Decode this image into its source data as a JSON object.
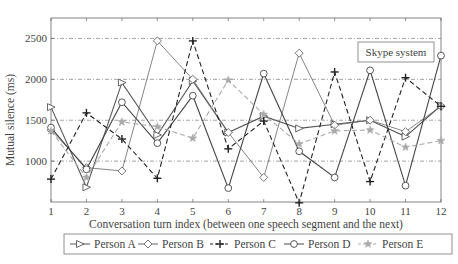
{
  "chart_data": {
    "type": "line",
    "title": "",
    "annotation": "Skype system",
    "xlabel": "Conversation turn index (between one speech segment and the next)",
    "ylabel": "Mutual silence (ms)",
    "x": [
      1,
      2,
      3,
      4,
      5,
      6,
      7,
      8,
      9,
      10,
      11,
      12
    ],
    "x_ticks": [
      "1",
      "2",
      "3",
      "4",
      "5",
      "6",
      "7",
      "8",
      "9",
      "10",
      "11",
      "12"
    ],
    "y_ticks": [
      "1000",
      "1500",
      "2000",
      "2500"
    ],
    "y_tick_values": [
      1000,
      1500,
      2000,
      2500
    ],
    "xlim": [
      1,
      12
    ],
    "ylim": [
      500,
      2750
    ],
    "grid": "horizontal dash-dot",
    "legend_position": "bottom",
    "series": [
      {
        "name": "Person A",
        "marker": "triangle-right",
        "style": "solid",
        "color": "#555555",
        "values": [
          1660,
          680,
          1960,
          1320,
          1980,
          1350,
          1550,
          1400,
          1450,
          1500,
          1300,
          1680
        ]
      },
      {
        "name": "Person B",
        "marker": "diamond",
        "style": "solid-thin",
        "color": "#666666",
        "values": [
          1380,
          920,
          880,
          2470,
          2000,
          1350,
          800,
          2320,
          1440,
          1500,
          1360,
          1670
        ]
      },
      {
        "name": "Person C",
        "marker": "plus",
        "style": "dashed",
        "color": "#222222",
        "values": [
          780,
          1590,
          1270,
          790,
          2470,
          1150,
          1490,
          490,
          2090,
          750,
          2020,
          1670
        ]
      },
      {
        "name": "Person D",
        "marker": "circle",
        "style": "solid",
        "color": "#444444",
        "values": [
          1410,
          900,
          1720,
          1220,
          1800,
          670,
          2070,
          1120,
          800,
          2110,
          700,
          2290
        ]
      },
      {
        "name": "Person E",
        "marker": "star",
        "style": "dashed",
        "color": "#aaaaaa",
        "values": [
          1370,
          800,
          1480,
          1420,
          1280,
          1990,
          1570,
          1210,
          1370,
          1380,
          1170,
          1250
        ]
      }
    ]
  }
}
